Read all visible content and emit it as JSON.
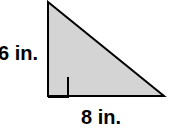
{
  "figure": {
    "kind": "right-triangle-diagram",
    "background_color": "#ffffff"
  },
  "shape": {
    "name": "right triangle",
    "fill_color": "#d4d4d4",
    "stroke_color": "#000000",
    "stroke_width": 2,
    "vertices": {
      "apex": [
        48,
        2
      ],
      "right_angle_corner": [
        48,
        96
      ],
      "base_right": [
        164,
        96
      ]
    },
    "right_angle_marker": {
      "name": "right-angle-mark",
      "size": 20,
      "stroke_color": "#000000",
      "stroke_width": 2
    }
  },
  "labels": {
    "height": "6 in.",
    "base": "8 in."
  },
  "measurements": {
    "height_value": 6,
    "base_value": 8,
    "units": "in."
  }
}
